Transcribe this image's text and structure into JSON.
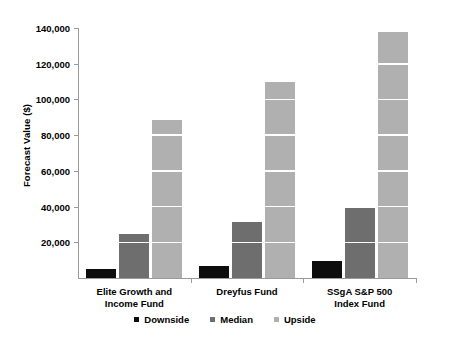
{
  "chart_data": {
    "type": "bar",
    "title": "",
    "xlabel": "",
    "ylabel": "Forecast Value ($)",
    "ylim": [
      0,
      140000
    ],
    "ytick_values": [
      0,
      20000,
      40000,
      60000,
      80000,
      100000,
      120000,
      140000
    ],
    "ytick_labels": [
      "",
      "20,000",
      "40,000",
      "60,000",
      "80,000",
      "100,000",
      "120,000",
      "140,000"
    ],
    "grid": "horizontal-white-over-bars",
    "legend_position": "bottom-center",
    "categories": [
      "Elite Growth and Income Fund",
      "Dreyfus Fund",
      "SSgA S&P 500 Index Fund"
    ],
    "category_lines": [
      [
        "Elite Growth and",
        "Income Fund"
      ],
      [
        "Dreyfus Fund",
        ""
      ],
      [
        "SSgA S&P 500",
        "Index Fund"
      ]
    ],
    "series": [
      {
        "name": "Downside",
        "color": "#0d0d0d",
        "values": [
          5000,
          7000,
          9500
        ]
      },
      {
        "name": "Median",
        "color": "#6e6e6e",
        "values": [
          24500,
          31500,
          39000
        ]
      },
      {
        "name": "Upside",
        "color": "#b0b0b0",
        "values": [
          88500,
          110000,
          138000
        ]
      }
    ]
  },
  "colors": {
    "downside": "#0d0d0d",
    "median": "#6e6e6e",
    "upside": "#b0b0b0",
    "axis": "#9a9a9a",
    "background": "#ffffff",
    "gridline": "#ffffff"
  }
}
